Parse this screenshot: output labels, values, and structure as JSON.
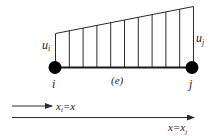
{
  "diagram": {
    "type": "finite-element-linear-interpolation",
    "element": {
      "label": "(e)",
      "node_i": {
        "label": "i",
        "value_label_main": "u",
        "value_label_sub": "i"
      },
      "node_j": {
        "label": "j",
        "value_label_main": "u",
        "value_label_sub": "j"
      },
      "vertical_line_count": 11
    },
    "axes": {
      "short_arrow": {
        "label_main": "x",
        "label_sub": "i",
        "label_rest": "=x"
      },
      "long_arrow": {
        "label_pre": "x=x",
        "label_sub": "j"
      }
    },
    "colors": {
      "line": "#2a2a2a",
      "node": "#000000",
      "background": "#ffffff"
    }
  }
}
